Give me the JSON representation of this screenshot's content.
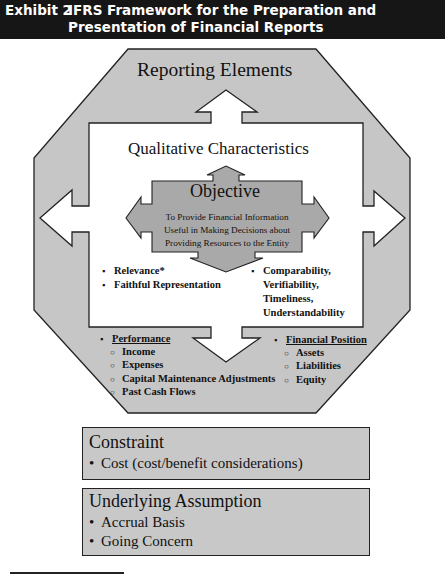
{
  "header": {
    "exhibit": "Exhibit 2",
    "title": "IFRS Framework for the Preparation and Presentation of Financial Reports"
  },
  "diagram": {
    "reporting_elements": "Reporting Elements",
    "qualitative_characteristics": "Qualitative Characteristics",
    "objective": {
      "title": "Objective",
      "lines": [
        "To Provide Financial Information",
        "Useful in Making Decisions about",
        "Providing Resources to the Entity"
      ]
    },
    "fundamental": [
      "Relevance*",
      "Faithful Representation"
    ],
    "enhancing": [
      "Comparability,",
      "Verifiability,",
      "Timeliness,",
      "Understandability"
    ],
    "performance": {
      "title": "Performance",
      "items": [
        "Income",
        "Expenses",
        "Capital Maintenance Adjustments",
        "Past Cash Flows"
      ]
    },
    "financial_position": {
      "title": "Financial Position",
      "items": [
        "Assets",
        "Liabilities",
        "Equity"
      ]
    }
  },
  "constraint": {
    "title": "Constraint",
    "items": [
      "Cost (cost/benefit considerations)"
    ]
  },
  "underlying_assumption": {
    "title": "Underlying Assumption",
    "items": [
      "Accrual Basis",
      "Going Concern"
    ]
  },
  "colors": {
    "header_bg": "#161616",
    "gray_fill": "#c6c6c6",
    "objective_fill": "#a9a9a9",
    "stroke": "#222222"
  }
}
